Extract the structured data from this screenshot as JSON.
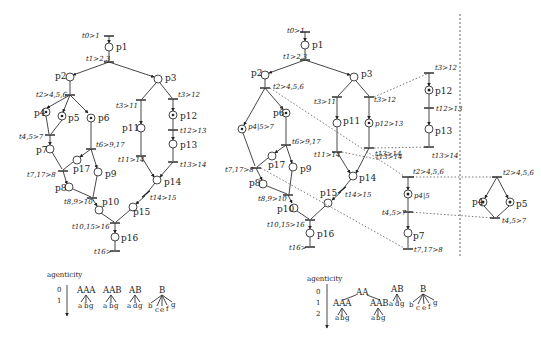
{
  "left_net": {
    "transitions": {
      "t0": "t0>1",
      "t1": "t1>2,3",
      "t2": "t2>4,5,6",
      "t3a": "t3>11",
      "t3b": "t3>12",
      "t45": "t4,5>7",
      "t6": "t6>9,17",
      "t12": "t12>13",
      "t11": "t11>14",
      "t13": "t13>14",
      "t717": "t7,17>8",
      "t89": "t8,9>10",
      "t14": "t14>15",
      "t1015": "t10,15>16",
      "t16": "t16>"
    },
    "places": {
      "p1": "p1",
      "p2": "p2",
      "p3": "p3",
      "p4": "p4",
      "p5": "p5",
      "p6": "p6",
      "p7": "p7",
      "p8": "p8",
      "p9": "p9",
      "p10": "p10",
      "p11": "p11",
      "p12": "p12",
      "p13": "p13",
      "p14": "p14",
      "p15": "p15",
      "p16": "p16",
      "p17": "p17"
    }
  },
  "right_net": {
    "transitions": {
      "t0": "t0>1",
      "t1": "t1>2,3",
      "t2": "t2>4,5,6",
      "t3a": "t3>11",
      "t3b": "t3>12",
      "t6": "t6>9,17",
      "t11": "t11>14",
      "t13": "t13>14",
      "t717": "t7,17>8",
      "t89": "t8,9>10",
      "t14": "t14>15",
      "t1015": "t10,15>16",
      "t16": "t16>"
    },
    "places": {
      "p1": "p1",
      "p2": "p2",
      "p3": "p3",
      "p415_7": "p4|5>7",
      "p6": "p6",
      "p8": "p8",
      "p9": "p9",
      "p10": "p10",
      "p11": "p11",
      "p1243": "p12>13",
      "p14": "p14",
      "p15": "p15",
      "p16": "p16",
      "p17": "p17"
    }
  },
  "subnet_p12": {
    "t3b": "t3>12",
    "p12": "p12",
    "t12": "t12>13",
    "p13": "p13",
    "t13a": "t13>14",
    "t13b": "t13>14"
  },
  "subnet_p415": {
    "t2": "t2>4,5,6",
    "p415": "p4|5",
    "t45": "t4,5>7",
    "p7": "p7",
    "t717": "t7,17>8"
  },
  "subnet_p4p5": {
    "t2": "t2>4,5,6",
    "p4": "p4",
    "p5": "p5",
    "t45": "t4,5>7"
  },
  "tree_left": {
    "axis_label": "agenticity",
    "levels": [
      "0",
      "1"
    ],
    "roots": [
      "AAA",
      "AAB",
      "AB",
      "B"
    ],
    "children": {
      "AAA": [
        "a",
        "b",
        "g"
      ],
      "AAB": [
        "a",
        "b",
        "g"
      ],
      "AB": [
        "a",
        "d",
        "g"
      ],
      "B": [
        "b",
        "c",
        "e",
        "f",
        "g"
      ]
    }
  },
  "tree_right": {
    "axis_label": "agenticity",
    "levels": [
      "0",
      "1",
      "2"
    ],
    "roots": [
      "AA",
      "AB",
      "B"
    ],
    "mid": [
      "AAA",
      "AAB"
    ],
    "children": {
      "AAA": [
        "a",
        "b",
        "g"
      ],
      "AAB": [
        "a",
        "b",
        "g"
      ],
      "AB": [
        "a",
        "d",
        "g"
      ],
      "B": [
        "b",
        "c",
        "e",
        "f",
        "g"
      ]
    }
  }
}
